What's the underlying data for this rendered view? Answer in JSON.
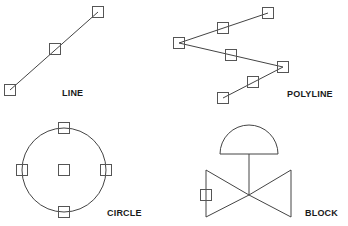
{
  "colors": {
    "stroke": "#444444",
    "grip": "#555555",
    "label": "#1a1a1a",
    "background": "#ffffff"
  },
  "grip_size": 11,
  "panels": [
    {
      "id": "line",
      "label": "LINE",
      "label_pos": [
        62,
        96
      ],
      "segments": [
        [
          10,
          90,
          98,
          12
        ]
      ],
      "grips": [
        [
          98,
          12
        ],
        [
          55,
          49
        ],
        [
          10,
          90
        ]
      ]
    },
    {
      "id": "polyline",
      "label": "POLYLINE",
      "label_pos": [
        287,
        97
      ],
      "points": [
        [
          268,
          13
        ],
        [
          179,
          43
        ],
        [
          283,
          67
        ],
        [
          223,
          98
        ]
      ],
      "grips": [
        [
          268,
          13
        ],
        [
          223,
          28
        ],
        [
          179,
          43
        ],
        [
          231,
          55
        ],
        [
          283,
          67
        ],
        [
          253,
          82
        ],
        [
          223,
          98
        ]
      ]
    },
    {
      "id": "circle",
      "label": "CIRCLE",
      "label_pos": [
        107,
        216
      ],
      "center": [
        64,
        170
      ],
      "radius": 42,
      "grips": [
        [
          64,
          128
        ],
        [
          22,
          170
        ],
        [
          64,
          170
        ],
        [
          106,
          170
        ],
        [
          64,
          212
        ]
      ]
    },
    {
      "id": "block",
      "label": "BLOCK",
      "label_pos": [
        305,
        216
      ],
      "dome": {
        "cx": 249,
        "base_y": 154,
        "r": 29
      },
      "stem": [
        249,
        154,
        249,
        195
      ],
      "valve_left": [
        [
          206,
          170
        ],
        [
          206,
          217
        ],
        [
          249,
          195
        ]
      ],
      "valve_right": [
        [
          291,
          170
        ],
        [
          291,
          217
        ],
        [
          249,
          195
        ]
      ],
      "grips": [
        [
          206,
          195
        ]
      ]
    }
  ]
}
